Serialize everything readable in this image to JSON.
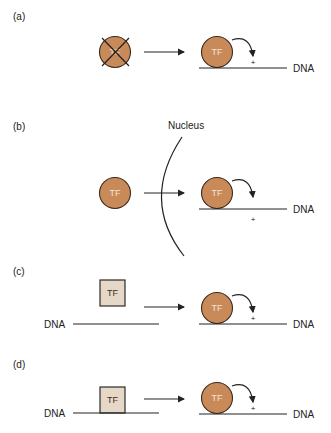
{
  "figure": {
    "colors": {
      "tf_circle_fill": "#c98a5a",
      "tf_square_fill": "#e6d8c6",
      "line": "#222222"
    },
    "panels": [
      {
        "label": "(a)",
        "left_tf_text": "TF",
        "left_tf_shape": "circle-crossed",
        "right_tf_text": "TF",
        "activation_sign": "+",
        "dna_label": "DNA"
      },
      {
        "label": "(b)",
        "left_tf_text": "TF",
        "left_tf_shape": "circle",
        "barrier_label": "Nucleus",
        "right_tf_text": "TF",
        "activation_sign": "+",
        "dna_label": "DNA"
      },
      {
        "label": "(c)",
        "left_tf_text": "TF",
        "left_tf_shape": "square-unbound",
        "left_dna_label": "DNA",
        "right_tf_text": "TF",
        "activation_sign": "+",
        "dna_label": "DNA"
      },
      {
        "label": "(d)",
        "left_tf_text": "TF",
        "left_tf_shape": "square-bound",
        "left_dna_label": "DNA",
        "right_tf_text": "TF",
        "activation_sign": "+",
        "dna_label": "DNA"
      }
    ]
  }
}
